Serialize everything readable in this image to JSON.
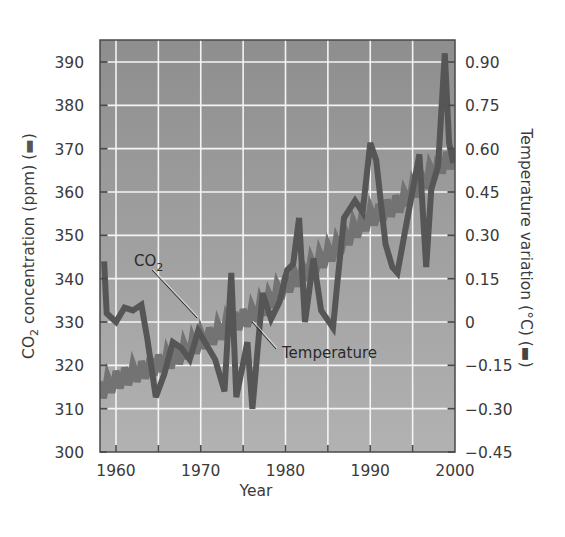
{
  "chart_data": {
    "type": "line",
    "title": "",
    "xlabel": "Year",
    "ylabel": "CO2 concentration (ppm)",
    "ylabel_right": "Temperature variation (°C)",
    "xlim": [
      1958,
      2000
    ],
    "ylim": [
      300,
      395
    ],
    "ylim_right": [
      -0.45,
      0.975
    ],
    "grid": true,
    "x_ticks": [
      1960,
      1970,
      1980,
      1990,
      2000
    ],
    "x_gridlines": [
      1960,
      1965,
      1970,
      1975,
      1980,
      1985,
      1990,
      1995
    ],
    "y_ticks": [
      300,
      310,
      320,
      330,
      340,
      350,
      360,
      370,
      380,
      390
    ],
    "y_ticks_right": [
      "-0.45",
      "-0.30",
      "-0.15",
      "0",
      "0.15",
      "0.30",
      "0.45",
      "0.60",
      "0.75",
      "0.90"
    ],
    "annotations": [
      {
        "text": "CO2",
        "points_to": "CO2 series near 1971"
      },
      {
        "text": "Temperature",
        "points_to": "Temperature series near 1978"
      }
    ],
    "series": [
      {
        "name": "CO2",
        "axis": "left",
        "unit": "ppm",
        "color": "#707070",
        "x": [
          1958,
          1960,
          1962,
          1964,
          1966,
          1968,
          1970,
          1972,
          1974,
          1976,
          1978,
          1980,
          1982,
          1984,
          1986,
          1988,
          1990,
          1992,
          1994,
          1996,
          1998,
          2000
        ],
        "values": [
          314,
          316.5,
          318,
          319.5,
          321,
          323,
          325.5,
          327.5,
          330,
          331.5,
          334.5,
          338.5,
          341,
          344,
          347,
          351,
          354,
          356,
          358,
          362,
          366,
          368
        ]
      },
      {
        "name": "Temperature",
        "axis": "right",
        "unit": "°C",
        "color": "#555555",
        "x": [
          1958.6,
          1958.9,
          1960,
          1961,
          1962,
          1963,
          1963.7,
          1964.7,
          1965.7,
          1966.7,
          1967.7,
          1968.7,
          1969.7,
          1971.7,
          1972.8,
          1973.6,
          1974.2,
          1975.5,
          1976.1,
          1977.3,
          1978.3,
          1979.3,
          1980.2,
          1980.9,
          1981.6,
          1982.3,
          1983.3,
          1984.2,
          1985.6,
          1986.1,
          1986.9,
          1988.2,
          1989.1,
          1990.0,
          1990.7,
          1991.8,
          1992.6,
          1993.2,
          1994.4,
          1995.8,
          1996.6,
          1997.2,
          1998.0,
          1998.8,
          1999.3,
          1999.8
        ],
        "values": [
          0.21,
          0.03,
          0.0,
          0.05,
          0.04,
          0.06,
          -0.06,
          -0.26,
          -0.18,
          -0.07,
          -0.09,
          -0.13,
          -0.03,
          -0.13,
          -0.24,
          0.17,
          -0.26,
          -0.07,
          -0.3,
          0.1,
          0.01,
          0.07,
          0.18,
          0.2,
          0.36,
          0.0,
          0.22,
          0.04,
          -0.02,
          0.13,
          0.36,
          0.42,
          0.38,
          0.62,
          0.56,
          0.27,
          0.19,
          0.17,
          0.36,
          0.58,
          0.19,
          0.46,
          0.54,
          0.93,
          0.62,
          0.55
        ]
      }
    ]
  },
  "axes": {
    "x_title": "Year",
    "left_title_main": "CO",
    "left_title_sub": "2",
    "left_title_rest": " concentration (ppm) (",
    "left_title_end": ")",
    "right_title": "Temperature variation (°C) (",
    "right_title_end": ")",
    "legend_swatch_left": "▬",
    "legend_swatch_right": "▬"
  },
  "annotations": {
    "co2_label_main": "CO",
    "co2_label_sub": "2",
    "temp_label": "Temperature"
  },
  "colors": {
    "plot_bg_top": "#8e8e8e",
    "plot_bg_bottom": "#b2b2b2",
    "grid": "#f4f4f4",
    "co2_line": "#737373",
    "temp_line": "#565656",
    "frame": "#4a4a4a"
  }
}
